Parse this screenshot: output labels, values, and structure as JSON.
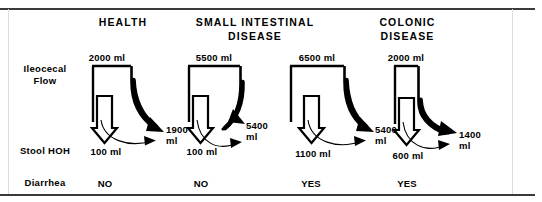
{
  "figure": {
    "row_labels": {
      "ileocecal_flow": "Ileocecal\nFlow",
      "stool_hoh": "Stool HOH",
      "diarrhea": "Diarrhea"
    },
    "columns": [
      {
        "header": "HEALTH",
        "ileocecal_flow": "2000 ml",
        "absorbed": "1900\nml",
        "stool_hoh": "100 ml",
        "diarrhea": "NO"
      },
      {
        "header": "SMALL INTESTINAL\nDISEASE",
        "ileocecal_flow": "5500 ml",
        "absorbed": "5400\nml",
        "stool_hoh": "100 ml",
        "diarrhea": "NO"
      },
      {
        "header": "COLONIC\nDISEASE",
        "ileocecal_flow": "6500 ml",
        "absorbed": "5400\nml",
        "stool_hoh": "1100 ml",
        "diarrhea": "YES"
      },
      {
        "header": "",
        "ileocecal_flow": "2000 ml",
        "absorbed": "1400\nml",
        "stool_hoh": "600 ml",
        "diarrhea": "YES"
      }
    ],
    "colors": {
      "ink": "#000000",
      "frame": "#3a3a3a",
      "frame_side": "#dcdcdc",
      "background": "#ffffff"
    }
  }
}
